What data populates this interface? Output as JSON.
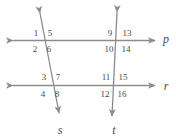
{
  "figure": {
    "kind": "two-parallel-lines-cut-by-two-transversals",
    "stroke_color": "#8c8c8c",
    "label_color": "#4a4a4a",
    "background_color": "#ffffff"
  },
  "lines": [
    {
      "id": "p",
      "label": "p",
      "orientation": "horizontal",
      "label_x": 166,
      "label_y": 39
    },
    {
      "id": "r",
      "label": "r",
      "orientation": "horizontal",
      "label_x": 166,
      "label_y": 86
    },
    {
      "id": "s",
      "label": "s",
      "orientation": "transversal",
      "label_x": 60,
      "label_y": 130
    },
    {
      "id": "t",
      "label": "t",
      "orientation": "transversal",
      "label_x": 114,
      "label_y": 130
    }
  ],
  "angle_labels": [
    {
      "number": "1",
      "x": 36,
      "y": 33,
      "vertex": "s-p",
      "position": "upper-left"
    },
    {
      "number": "5",
      "x": 50,
      "y": 33,
      "vertex": "s-p",
      "position": "upper-right"
    },
    {
      "number": "2",
      "x": 35,
      "y": 49,
      "vertex": "s-p",
      "position": "lower-left"
    },
    {
      "number": "6",
      "x": 49,
      "y": 49,
      "vertex": "s-p",
      "position": "lower-right"
    },
    {
      "number": "9",
      "x": 110,
      "y": 33,
      "vertex": "t-p",
      "position": "upper-left"
    },
    {
      "number": "13",
      "x": 127,
      "y": 33,
      "vertex": "t-p",
      "position": "upper-right"
    },
    {
      "number": "10",
      "x": 109,
      "y": 49,
      "vertex": "t-p",
      "position": "lower-left"
    },
    {
      "number": "14",
      "x": 126,
      "y": 49,
      "vertex": "t-p",
      "position": "lower-right"
    },
    {
      "number": "3",
      "x": 44,
      "y": 77,
      "vertex": "s-r",
      "position": "upper-left"
    },
    {
      "number": "7",
      "x": 58,
      "y": 77,
      "vertex": "s-r",
      "position": "upper-right"
    },
    {
      "number": "4",
      "x": 43,
      "y": 94,
      "vertex": "s-r",
      "position": "lower-left"
    },
    {
      "number": "8",
      "x": 57,
      "y": 94,
      "vertex": "s-r",
      "position": "lower-right"
    },
    {
      "number": "11",
      "x": 106,
      "y": 77,
      "vertex": "t-r",
      "position": "upper-left"
    },
    {
      "number": "15",
      "x": 123,
      "y": 77,
      "vertex": "t-r",
      "position": "upper-right"
    },
    {
      "number": "12",
      "x": 105,
      "y": 94,
      "vertex": "t-r",
      "position": "lower-left"
    },
    {
      "number": "16",
      "x": 122,
      "y": 94,
      "vertex": "t-r",
      "position": "lower-right"
    }
  ]
}
